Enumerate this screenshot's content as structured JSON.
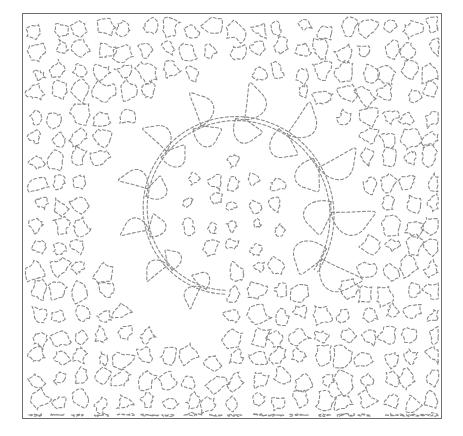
{
  "image": {
    "subject": "quilting stitch pattern",
    "description": "feathered wreath spiral over stipple (meander) background",
    "width": 463,
    "height": 436
  },
  "frame": {
    "x": 22,
    "y": 13,
    "width": 420,
    "height": 406,
    "border_color": "#6e6e6e",
    "border_width": 1.5
  },
  "style": {
    "stroke_color": "#8a8a8a",
    "stroke_width": 1.1,
    "dash": "3 2.2",
    "background": "#ffffff"
  },
  "wreath": {
    "center": [
      232,
      212
    ],
    "start_angle_deg": 95,
    "sweep_deg": 300,
    "inner_radius": 62,
    "outer_radius": 135,
    "plumes_per_side": 11
  },
  "stipple": {
    "seed": 7,
    "cell": 22,
    "center_dense_radius": 55
  }
}
